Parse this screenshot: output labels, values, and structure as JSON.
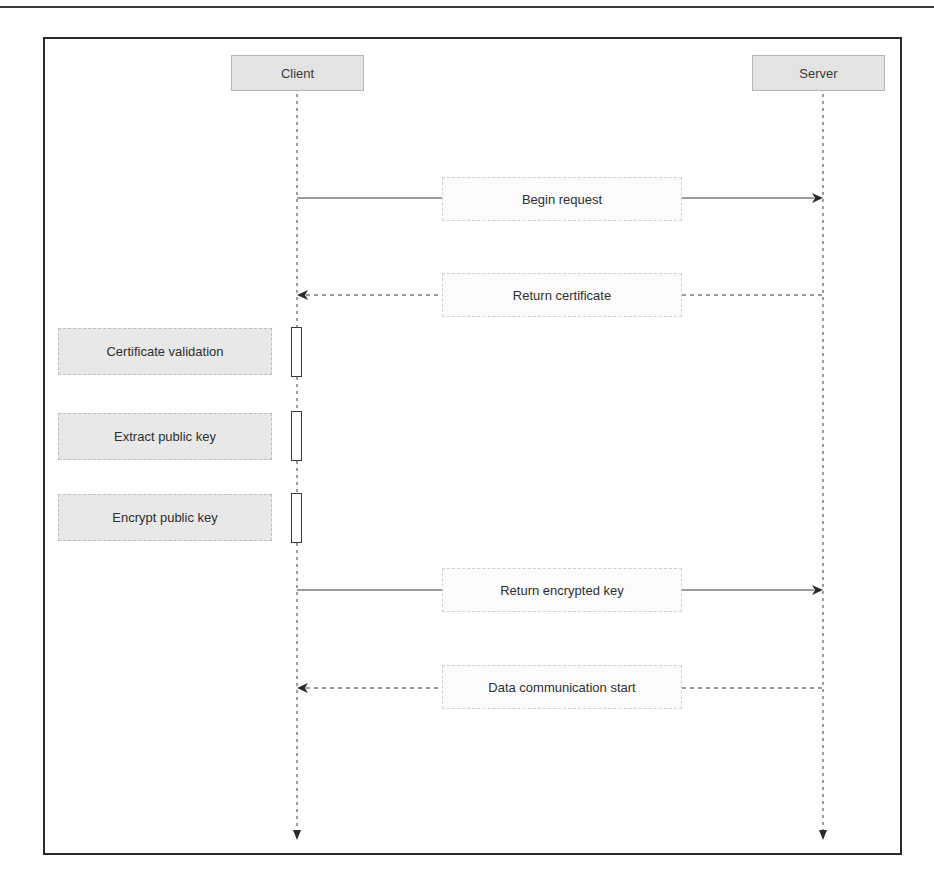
{
  "diagram": {
    "type": "sequence",
    "participants": [
      {
        "id": "client",
        "label": "Client"
      },
      {
        "id": "server",
        "label": "Server"
      }
    ],
    "messages": [
      {
        "label": "Begin request",
        "from": "client",
        "to": "server",
        "style": "solid"
      },
      {
        "label": "Return certificate",
        "from": "server",
        "to": "client",
        "style": "dashed"
      },
      {
        "label": "Return encrypted key",
        "from": "client",
        "to": "server",
        "style": "solid"
      },
      {
        "label": "Data communication start",
        "from": "server",
        "to": "client",
        "style": "dashed"
      }
    ],
    "client_processes": [
      {
        "label": "Certificate validation"
      },
      {
        "label": "Extract public key"
      },
      {
        "label": "Encrypt public key"
      }
    ],
    "colors": {
      "frame": "#2b2b2b",
      "actor_fill": "#e3e3e3",
      "process_fill": "#e8e8e8",
      "line": "#3a3a3a"
    }
  }
}
